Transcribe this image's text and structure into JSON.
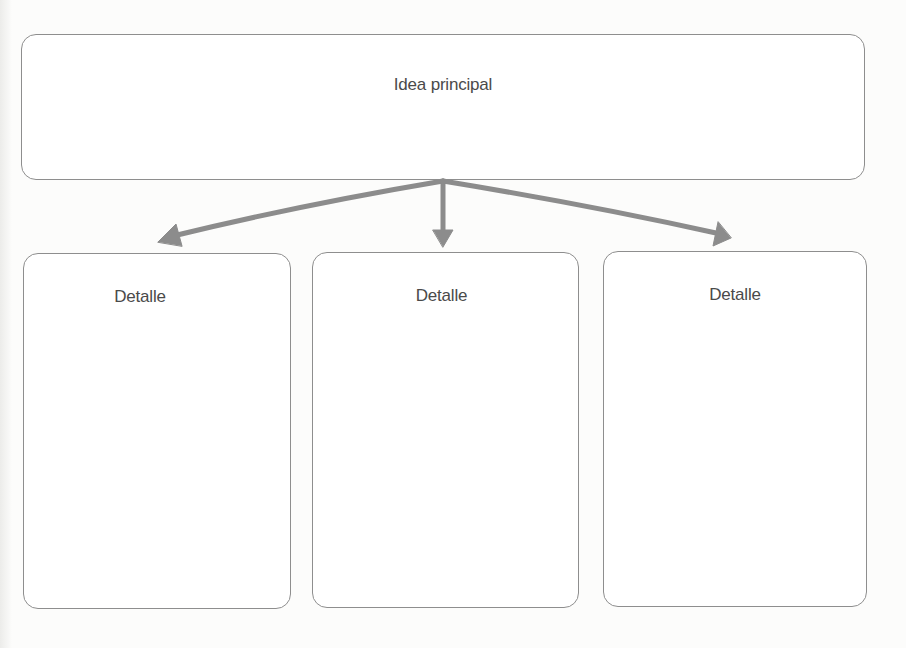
{
  "diagram": {
    "type": "hierarchy",
    "main": {
      "label": "Idea principal"
    },
    "details": [
      {
        "label": "Detalle"
      },
      {
        "label": "Detalle"
      },
      {
        "label": "Detalle"
      }
    ],
    "connectors": [
      {
        "from": "main",
        "to": "detail-1",
        "style": "arrow"
      },
      {
        "from": "main",
        "to": "detail-2",
        "style": "arrow"
      },
      {
        "from": "main",
        "to": "detail-3",
        "style": "arrow"
      }
    ],
    "colors": {
      "border": "#8e8e8e",
      "arrow": "#8c8c8c",
      "text": "#4a4a4a",
      "background": "#fcfcfb"
    }
  }
}
